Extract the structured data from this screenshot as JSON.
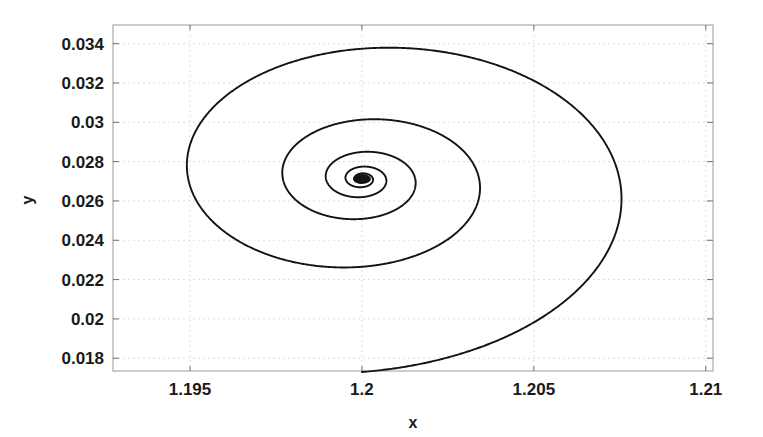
{
  "figure": {
    "background_color": "#ffffff",
    "width": 763,
    "height": 437
  },
  "axes": {
    "box": {
      "left": 113,
      "top": 25,
      "right": 713,
      "bottom": 371
    },
    "line_color": "#9a9a9a",
    "grid_color": "#d8d8d8",
    "tick_color": "#6e6e6e"
  },
  "x_axis": {
    "label": "x",
    "min": 1.19276,
    "max": 1.21021,
    "tick_values": [
      1.195,
      1.2,
      1.205,
      1.21
    ],
    "tick_labels": [
      "1.195",
      "1.2",
      "1.205",
      "1.21"
    ]
  },
  "y_axis": {
    "label": "y",
    "min": 0.01735,
    "max": 0.03495,
    "tick_values": [
      0.018,
      0.02,
      0.022,
      0.024,
      0.026,
      0.028,
      0.03,
      0.032,
      0.034
    ],
    "tick_labels": [
      "0.018",
      "0.02",
      "0.022",
      "0.024",
      "0.026",
      "0.028",
      "0.03",
      "0.032",
      "0.034"
    ]
  },
  "chart_data": {
    "type": "line",
    "title": "",
    "xlabel": "x",
    "ylabel": "y",
    "xlim": [
      1.19276,
      1.21021
    ],
    "ylim": [
      0.01735,
      0.03495
    ],
    "grid": true,
    "legend": null,
    "series": [
      {
        "name": "trajectory",
        "color": "#131313",
        "line_width": 1.9,
        "description": "inward decaying spiral converging to a fixed point",
        "fixed_point": {
          "x": 1.2,
          "y": 0.02712
        },
        "spiral_model": {
          "form": "logarithmic-decay",
          "theta_start_deg": -90,
          "theta_end_deg": 1710,
          "turns": 5,
          "radius_x_start": 0.00912,
          "radius_y_start": 0.00982,
          "decay_per_turn": 0.455,
          "direction": "counterclockwise-inward"
        },
        "landmark_points": [
          {
            "x": 1.2,
            "y": 0.01757,
            "note": "tail start, bottom"
          },
          {
            "x": 1.21015,
            "y": 0.02544,
            "note": "outer right extremum"
          },
          {
            "x": 1.20242,
            "y": 0.03472,
            "note": "outer top extremum"
          },
          {
            "x": 1.19315,
            "y": 0.02855,
            "note": "outer left extremum"
          },
          {
            "x": 1.19973,
            "y": 0.02162,
            "note": "outer bottom extremum"
          },
          {
            "x": 1.20597,
            "y": 0.02444,
            "note": "2nd turn right extremum"
          },
          {
            "x": 1.20035,
            "y": 0.03148,
            "note": "2nd turn top extremum"
          },
          {
            "x": 1.19611,
            "y": 0.02795,
            "note": "2nd turn left extremum"
          },
          {
            "x": 1.19982,
            "y": 0.02398,
            "note": "2nd turn bottom extremum"
          },
          {
            "x": 1.20295,
            "y": 0.026,
            "note": "3rd turn right extremum"
          },
          {
            "x": 1.20005,
            "y": 0.0292,
            "note": "3rd turn top extremum"
          },
          {
            "x": 1.19821,
            "y": 0.02768,
            "note": "3rd turn left extremum"
          },
          {
            "x": 1.19993,
            "y": 0.0253,
            "note": "3rd turn bottom extremum"
          },
          {
            "x": 1.20139,
            "y": 0.02664,
            "note": "4th turn right extremum"
          },
          {
            "x": 1.19997,
            "y": 0.0281,
            "note": "4th turn top extremum"
          },
          {
            "x": 1.19921,
            "y": 0.0274,
            "note": "4th turn left extremum"
          },
          {
            "x": 1.19997,
            "y": 0.02622,
            "note": "4th turn bottom extremum"
          },
          {
            "x": 1.20063,
            "y": 0.02695,
            "note": "5th turn right extremum"
          },
          {
            "x": 1.2,
            "y": 0.02712,
            "note": "convergence point"
          }
        ]
      }
    ]
  }
}
